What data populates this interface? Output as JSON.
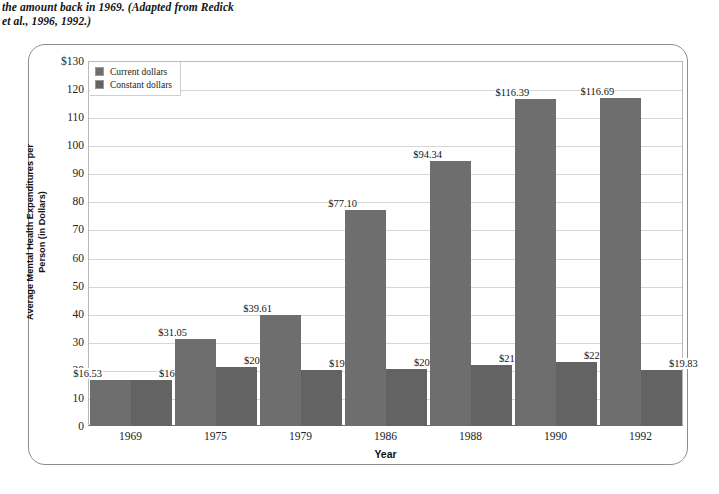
{
  "caption": {
    "line1": "the amount back in 1969. (Adapted from Redick",
    "line2": "et al., 1996, 1992.)"
  },
  "chart_data": {
    "type": "bar",
    "title": "",
    "xlabel": "Year",
    "ylabel": "Average Mental Health Expenditures per Person (in Dollars)",
    "categories": [
      "1969",
      "1975",
      "1979",
      "1986",
      "1988",
      "1990",
      "1992"
    ],
    "ylim": [
      0,
      130
    ],
    "ytick_labels": [
      "$130",
      "120",
      "110",
      "100",
      "90",
      "80",
      "70",
      "60",
      "50",
      "40",
      "30",
      "20",
      "10",
      "0"
    ],
    "ytick_values": [
      130,
      120,
      110,
      100,
      90,
      80,
      70,
      60,
      50,
      40,
      30,
      20,
      10,
      0
    ],
    "grid": true,
    "legend_position": "top-left",
    "series": [
      {
        "name": "Current dollars",
        "color": "#6e6e6e",
        "values": [
          16.53,
          31.05,
          39.61,
          77.1,
          94.34,
          116.39,
          116.69
        ],
        "labels": [
          "$16.53",
          "$31.05",
          "$39.61",
          "$77.10",
          "$94.34",
          "$116.39",
          "$116.69"
        ]
      },
      {
        "name": "Constant dollars",
        "color": "#636363",
        "values": [
          16.53,
          20.88,
          19.87,
          20.15,
          21.72,
          22.81,
          19.83
        ],
        "labels": [
          "$16.53",
          "$20.88",
          "$19.87",
          "$20.15",
          "$21.72",
          "$22.81",
          "$19.83"
        ]
      }
    ]
  }
}
